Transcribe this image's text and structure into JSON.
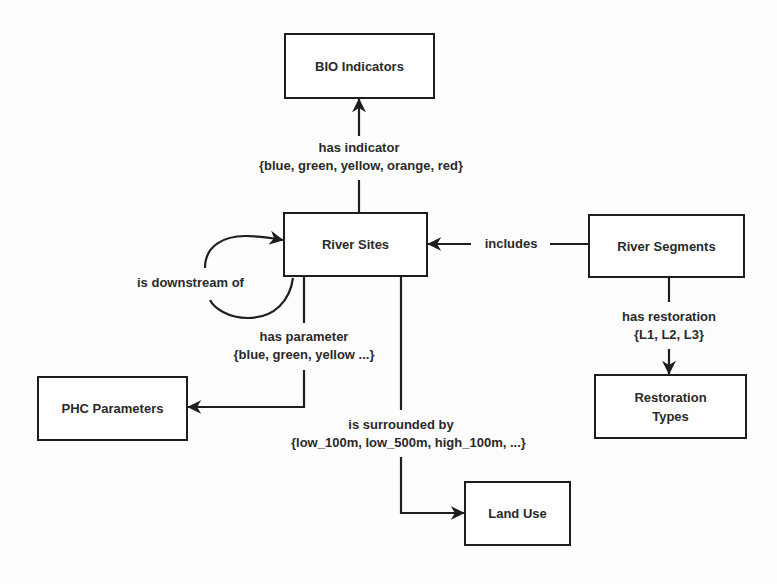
{
  "diagram": {
    "type": "entity-relationship",
    "nodes": [
      {
        "id": "bio",
        "label": "BIO Indicators"
      },
      {
        "id": "river_sites",
        "label": "River Sites"
      },
      {
        "id": "river_segments",
        "label": "River Segments"
      },
      {
        "id": "phc",
        "label": "PHC Parameters"
      },
      {
        "id": "restoration",
        "label": "Restoration Types"
      },
      {
        "id": "land_use",
        "label": "Land Use"
      }
    ],
    "edges": [
      {
        "from": "river_sites",
        "to": "bio",
        "label": "has indicator",
        "values": "{blue, green, yellow, orange, red}"
      },
      {
        "from": "river_sites",
        "to": "river_sites",
        "label": "is downstream of",
        "values": ""
      },
      {
        "from": "river_segments",
        "to": "river_sites",
        "label": "includes",
        "values": ""
      },
      {
        "from": "river_sites",
        "to": "phc",
        "label": "has parameter",
        "values": "{blue, green, yellow ...}"
      },
      {
        "from": "river_segments",
        "to": "restoration",
        "label": "has restoration",
        "values": "{L1, L2, L3}"
      },
      {
        "from": "river_sites",
        "to": "land_use",
        "label": "is surrounded by",
        "values": "{low_100m, low_500m, high_100m, ...}"
      }
    ]
  },
  "nodes": {
    "bio": "BIO Indicators",
    "river_sites": "River Sites",
    "river_segments": "River Segments",
    "phc": "PHC Parameters",
    "restoration_line1": "Restoration",
    "restoration_line2": "Types",
    "land_use": "Land Use"
  },
  "edges": {
    "has_indicator": {
      "label": "has indicator",
      "values": "{blue, green, yellow, orange, red}"
    },
    "downstream": {
      "label": "is downstream of"
    },
    "includes": {
      "label": "includes"
    },
    "has_parameter": {
      "label": "has parameter",
      "values": "{blue, green, yellow ...}"
    },
    "has_restoration": {
      "label": "has restoration",
      "values": "{L1, L2, L3}"
    },
    "surrounded": {
      "label": "is surrounded by",
      "values": "{low_100m, low_500m, high_100m, ...}"
    }
  },
  "colors": {
    "stroke": "#1e1e1e",
    "text": "#2a2a2a",
    "background": "#fdfdfd"
  }
}
